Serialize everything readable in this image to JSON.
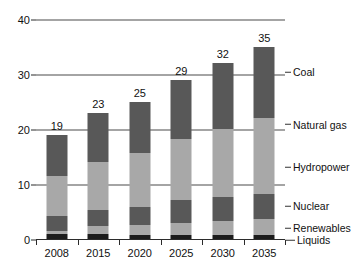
{
  "chart_data": {
    "type": "bar",
    "stacked": true,
    "title": "",
    "subtitle": "",
    "xlabel": "",
    "ylabel": "",
    "categories": [
      "2008",
      "2015",
      "2020",
      "2025",
      "2030",
      "2035"
    ],
    "series": [
      {
        "name": "Liquids",
        "color": "#1c1c1c",
        "values": [
          0.9,
          0.9,
          0.8,
          0.7,
          0.7,
          0.7
        ]
      },
      {
        "name": "Renewables",
        "color": "#a8a8a8",
        "values": [
          0.6,
          1.4,
          1.7,
          2.3,
          2.5,
          3.0
        ]
      },
      {
        "name": "Nuclear",
        "color": "#585858",
        "values": [
          2.6,
          2.9,
          3.4,
          4.1,
          4.4,
          4.5
        ]
      },
      {
        "name": "Hydropower",
        "color": "#a8a8a8",
        "values": [
          3.0,
          3.3,
          3.6,
          3.9,
          4.2,
          4.6
        ]
      },
      {
        "name": "Natural gas",
        "color": "#a8a8a8",
        "values": [
          4.4,
          5.5,
          6.2,
          7.1,
          8.2,
          9.2
        ]
      },
      {
        "name": "Coal",
        "color": "#585858",
        "values": [
          7.5,
          9.0,
          9.3,
          10.9,
          12.0,
          13.0
        ]
      }
    ],
    "bar_totals": [
      19,
      23,
      25,
      29,
      32,
      35
    ],
    "bar_total_labels": [
      "19",
      "23",
      "25",
      "29",
      "32",
      "35"
    ],
    "yticks": [
      0,
      10,
      20,
      30,
      40
    ],
    "ytick_labels": [
      "0",
      "10",
      "20",
      "30",
      "40"
    ],
    "ylim": [
      0,
      40
    ],
    "grid": true,
    "grid_color": "#4a4a4a",
    "legend_position": "right-inline",
    "legend_entries": [
      {
        "label": "Coal",
        "value": 30.5
      },
      {
        "label": "Natural gas",
        "value": 21.0
      },
      {
        "label": "Hydropower",
        "value": 13.2
      },
      {
        "label": "Nuclear",
        "value": 6.2
      },
      {
        "label": "Renewables",
        "value": 2.2
      },
      {
        "label": "Liquids",
        "value": 0.0
      }
    ],
    "background_color": "#ffffff",
    "axis_color": "#2b2b2b"
  }
}
